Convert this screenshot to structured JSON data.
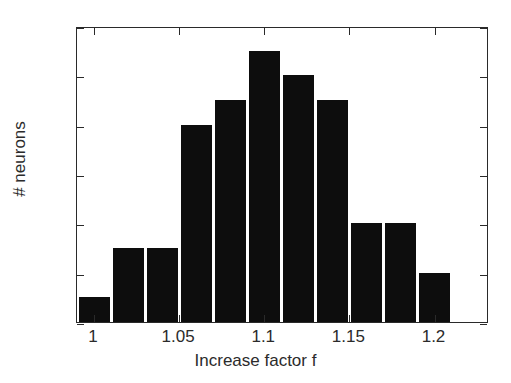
{
  "chart_data": {
    "type": "bar",
    "title": "",
    "subtitle": "",
    "xlabel": "Increase factor f",
    "ylabel": "# neurons",
    "xlim": [
      0.99,
      1.232
    ],
    "ylim": [
      0,
      12
    ],
    "grid": false,
    "legend": null,
    "bar_color": "#0d0d0d",
    "axis_color": "#2a2a2a",
    "background": "#ffffff",
    "bin_width": 0.02,
    "categories": [
      "1.00",
      "1.02",
      "1.04",
      "1.06",
      "1.08",
      "1.10",
      "1.12",
      "1.14",
      "1.16",
      "1.18",
      "1.20"
    ],
    "x": [
      1.0,
      1.02,
      1.04,
      1.06,
      1.08,
      1.1,
      1.12,
      1.14,
      1.16,
      1.18,
      1.2
    ],
    "values": [
      1,
      3,
      3,
      8,
      9,
      11,
      10,
      9,
      4,
      4,
      2
    ],
    "xticks": [
      {
        "value": 1.0,
        "label": "1"
      },
      {
        "value": 1.05,
        "label": "1.05"
      },
      {
        "value": 1.1,
        "label": "1.1"
      },
      {
        "value": 1.15,
        "label": "1.15"
      },
      {
        "value": 1.2,
        "label": "1.2"
      }
    ],
    "yticks": [
      {
        "value": 0,
        "label": "0"
      },
      {
        "value": 2,
        "label": "2"
      },
      {
        "value": 4,
        "label": "4"
      },
      {
        "value": 6,
        "label": "6"
      },
      {
        "value": 8,
        "label": "8"
      },
      {
        "value": 10,
        "label": "10"
      },
      {
        "value": 12,
        "label": "12"
      }
    ]
  }
}
